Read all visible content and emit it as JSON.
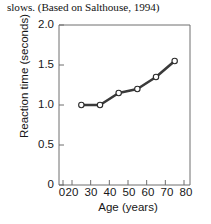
{
  "caption": "slows. (Based on Salthouse, 1994)",
  "chart_data": {
    "type": "line",
    "title": "",
    "xlabel": "Age (years)",
    "ylabel": "Reaction time (seconds)",
    "x": [
      25,
      35,
      45,
      55,
      65,
      75
    ],
    "values": [
      1.0,
      1.0,
      1.15,
      1.2,
      1.35,
      1.55
    ],
    "series": [
      {
        "name": "Reaction time",
        "x": [
          25,
          35,
          45,
          55,
          65,
          75
        ],
        "values": [
          1.0,
          1.0,
          1.15,
          1.2,
          1.35,
          1.55
        ]
      }
    ],
    "xlim": [
      20,
      80
    ],
    "ylim": [
      0,
      2.0
    ],
    "xticks": [
      0,
      20,
      30,
      40,
      50,
      60,
      70,
      80
    ],
    "xtick_labels": [
      "0",
      "20",
      "30",
      "40",
      "50",
      "60",
      "70",
      "80"
    ],
    "yticks": [
      0,
      0.5,
      1.0,
      1.5,
      2.0
    ],
    "ytick_labels": [
      "0",
      "0.5",
      "1.0",
      "1.5",
      "2.0"
    ],
    "grid": false,
    "legend": false,
    "marker": "open-circle",
    "line_color": "#3a3a3a",
    "marker_fill": "#ffffff",
    "axis_color": "#6e6e6e",
    "axis_break": true
  }
}
